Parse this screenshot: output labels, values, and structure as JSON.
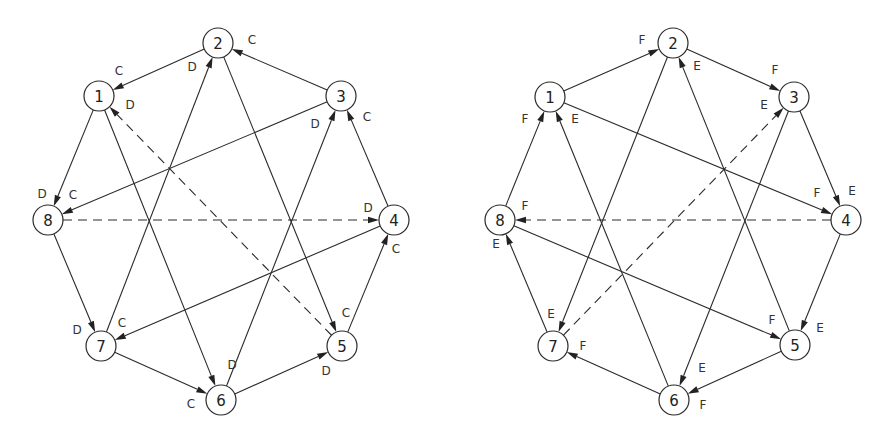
{
  "diagrams": [
    {
      "id": "left-graph",
      "node_radius": 15,
      "nodes": [
        {
          "id": "1",
          "label": "1",
          "x": 99,
          "y": 96
        },
        {
          "id": "2",
          "label": "2",
          "x": 218,
          "y": 43
        },
        {
          "id": "3",
          "label": "3",
          "x": 341,
          "y": 96
        },
        {
          "id": "4",
          "label": "4",
          "x": 394,
          "y": 220
        },
        {
          "id": "5",
          "label": "5",
          "x": 342,
          "y": 346
        },
        {
          "id": "6",
          "label": "6",
          "x": 221,
          "y": 400
        },
        {
          "id": "7",
          "label": "7",
          "x": 101,
          "y": 346
        },
        {
          "id": "8",
          "label": "8",
          "x": 48,
          "y": 220
        }
      ],
      "edges": [
        {
          "from": "3",
          "to": "2",
          "label": "C",
          "lx": 252,
          "ly": 40,
          "dashed": false
        },
        {
          "from": "2",
          "to": "1",
          "label": "C",
          "lx": 119,
          "ly": 71,
          "dashed": false
        },
        {
          "from": "7",
          "to": "2",
          "label": "D",
          "lx": 192,
          "ly": 67,
          "dashed": false
        },
        {
          "from": "2",
          "to": "5",
          "label": "C",
          "lx": 346,
          "ly": 313,
          "dashed": false
        },
        {
          "from": "1",
          "to": "8",
          "label": "D",
          "lx": 42,
          "ly": 194,
          "dashed": false
        },
        {
          "from": "3",
          "to": "8",
          "label": "C",
          "lx": 73,
          "ly": 195,
          "dashed": false
        },
        {
          "from": "1",
          "to": "6",
          "label": "D",
          "lx": 232,
          "ly": 365,
          "dashed": false
        },
        {
          "from": "5",
          "to": "1",
          "label": "D",
          "lx": 130,
          "ly": 105,
          "dashed": true
        },
        {
          "from": "6",
          "to": "3",
          "label": "D",
          "lx": 315,
          "ly": 124,
          "dashed": false
        },
        {
          "from": "4",
          "to": "3",
          "label": "C",
          "lx": 367,
          "ly": 117,
          "dashed": false
        },
        {
          "from": "8",
          "to": "4",
          "label": "D",
          "lx": 368,
          "ly": 208,
          "dashed": true
        },
        {
          "from": "5",
          "to": "4",
          "label": "C",
          "lx": 396,
          "ly": 249,
          "dashed": false
        },
        {
          "from": "8",
          "to": "7",
          "label": "D",
          "lx": 77,
          "ly": 330,
          "dashed": false
        },
        {
          "from": "4",
          "to": "7",
          "label": "C",
          "lx": 122,
          "ly": 323,
          "dashed": false
        },
        {
          "from": "7",
          "to": "6",
          "label": "C",
          "lx": 191,
          "ly": 404,
          "dashed": false
        },
        {
          "from": "6",
          "to": "5",
          "label": "D",
          "lx": 326,
          "ly": 371,
          "dashed": false
        }
      ]
    },
    {
      "id": "right-graph",
      "node_radius": 15,
      "nodes": [
        {
          "id": "1",
          "label": "1",
          "x": 550,
          "y": 97
        },
        {
          "id": "2",
          "label": "2",
          "x": 673,
          "y": 43
        },
        {
          "id": "3",
          "label": "3",
          "x": 794,
          "y": 97
        },
        {
          "id": "4",
          "label": "4",
          "x": 846,
          "y": 220
        },
        {
          "id": "5",
          "label": "5",
          "x": 795,
          "y": 345
        },
        {
          "id": "6",
          "label": "6",
          "x": 674,
          "y": 400
        },
        {
          "id": "7",
          "label": "7",
          "x": 553,
          "y": 346
        },
        {
          "id": "8",
          "label": "8",
          "x": 500,
          "y": 220
        }
      ],
      "edges": [
        {
          "from": "1",
          "to": "2",
          "label": "F",
          "lx": 642,
          "ly": 40,
          "dashed": false
        },
        {
          "from": "2",
          "to": "3",
          "label": "F",
          "lx": 775,
          "ly": 70,
          "dashed": false
        },
        {
          "from": "5",
          "to": "2",
          "label": "E",
          "lx": 697,
          "ly": 66,
          "dashed": false
        },
        {
          "from": "2",
          "to": "7",
          "label": "E",
          "lx": 551,
          "ly": 314,
          "dashed": false
        },
        {
          "from": "8",
          "to": "1",
          "label": "F",
          "lx": 525,
          "ly": 119,
          "dashed": false
        },
        {
          "from": "6",
          "to": "1",
          "label": "E",
          "lx": 575,
          "ly": 119,
          "dashed": false
        },
        {
          "from": "1",
          "to": "4",
          "label": "F",
          "lx": 817,
          "ly": 193,
          "dashed": false
        },
        {
          "from": "7",
          "to": "3",
          "label": "E",
          "lx": 764,
          "ly": 105,
          "dashed": true
        },
        {
          "from": "3",
          "to": "4",
          "label": "E",
          "lx": 852,
          "ly": 191,
          "dashed": false
        },
        {
          "from": "3",
          "to": "6",
          "label": "E",
          "lx": 702,
          "ly": 368,
          "dashed": false
        },
        {
          "from": "4",
          "to": "8",
          "label": "F",
          "lx": 525,
          "ly": 206,
          "dashed": true
        },
        {
          "from": "4",
          "to": "5",
          "label": "E",
          "lx": 820,
          "ly": 328,
          "dashed": false
        },
        {
          "from": "8",
          "to": "5",
          "label": "F",
          "lx": 772,
          "ly": 320,
          "dashed": false
        },
        {
          "from": "7",
          "to": "8",
          "label": "E",
          "lx": 496,
          "ly": 244,
          "dashed": false
        },
        {
          "from": "6",
          "to": "7",
          "label": "F",
          "lx": 583,
          "ly": 346,
          "dashed": false
        },
        {
          "from": "5",
          "to": "6",
          "label": "F",
          "lx": 703,
          "ly": 405,
          "dashed": false
        }
      ]
    }
  ]
}
